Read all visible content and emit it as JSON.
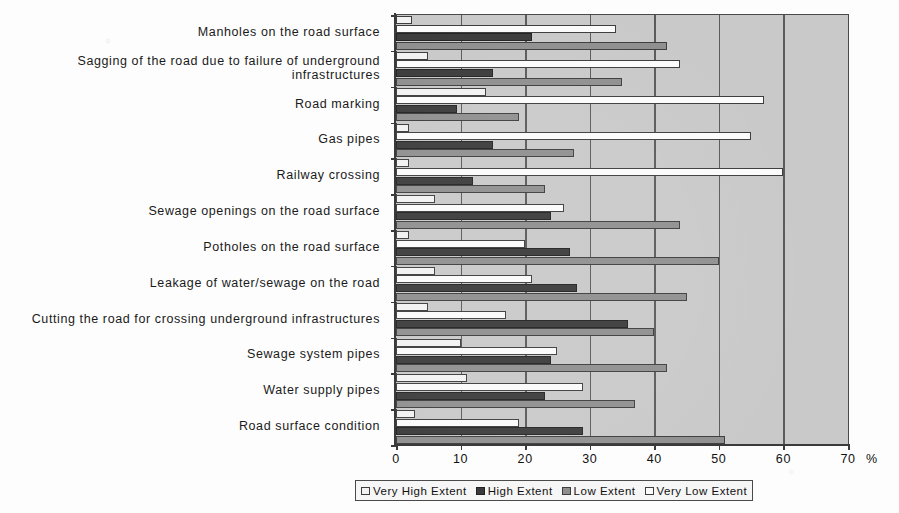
{
  "chart_data": {
    "type": "bar",
    "orientation": "horizontal",
    "title": "",
    "xlabel": "%",
    "ylabel": "",
    "xlim": [
      0,
      70
    ],
    "xticks": [
      0,
      10,
      20,
      30,
      40,
      50,
      60,
      70
    ],
    "xtick_labels": [
      "0",
      "10",
      "20",
      "30",
      "40",
      "50",
      "60",
      "70"
    ],
    "x_unit": "%",
    "grid": true,
    "legend_position": "bottom",
    "categories": [
      "Manholes on the road surface",
      "Sagging of the road due to failure of underground infrastructures",
      "Road marking",
      "Gas pipes",
      "Railway crossing",
      "Sewage openings on the road surface",
      "Potholes on the road surface",
      "Leakage of water/sewage on the road",
      "Cutting the road for crossing underground infrastructures",
      "Sewage system pipes",
      "Water supply pipes",
      "Road surface condition"
    ],
    "series": [
      {
        "name": "Very High Extent",
        "color": "#f2f2f2",
        "values": [
          2.5,
          5,
          14,
          2,
          2,
          6,
          2,
          6,
          5,
          10,
          11,
          3
        ]
      },
      {
        "name": "Very Low Extent",
        "color": "#fbfbfb",
        "values": [
          34,
          44,
          57,
          55,
          60,
          26,
          20,
          21,
          17,
          25,
          29,
          19
        ]
      },
      {
        "name": "High Extent",
        "color": "#3b3b3b",
        "values": [
          21,
          15,
          9.5,
          15,
          12,
          24,
          27,
          28,
          36,
          24,
          23,
          29
        ]
      },
      {
        "name": "Low Extent",
        "color": "#8f8f8f",
        "values": [
          42,
          35,
          19,
          27.5,
          23,
          44,
          50,
          45,
          40,
          42,
          37,
          51
        ]
      }
    ]
  },
  "legend": {
    "items": [
      {
        "label": "Very High Extent",
        "swatch": "veryhigh"
      },
      {
        "label": "High Extent",
        "swatch": "high"
      },
      {
        "label": "Low Extent",
        "swatch": "low"
      },
      {
        "label": "Very Low Extent",
        "swatch": "verylow"
      }
    ]
  }
}
